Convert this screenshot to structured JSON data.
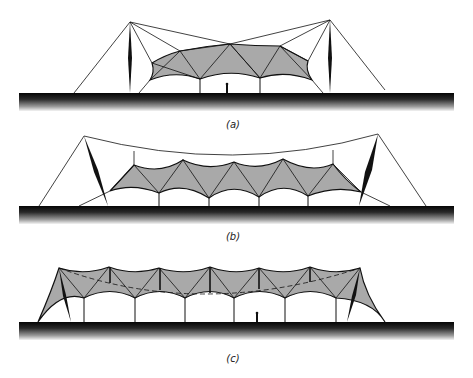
{
  "figure": {
    "panels": [
      {
        "id": "a",
        "label": "(a)",
        "description": "Twin-mast stayed tensile membrane canopy with central suspended peak"
      },
      {
        "id": "b",
        "label": "(b)",
        "description": "Raked end masts carrying a catenary ridge cable supporting a four-bay membrane"
      },
      {
        "id": "c",
        "label": "(c)",
        "description": "Continuous six-bay membrane with internal flying struts and raked end masts"
      }
    ],
    "colors": {
      "membrane": "#a9a9a9",
      "line": "#111111",
      "ground": "#0a0a0a",
      "background": "#ffffff"
    }
  }
}
